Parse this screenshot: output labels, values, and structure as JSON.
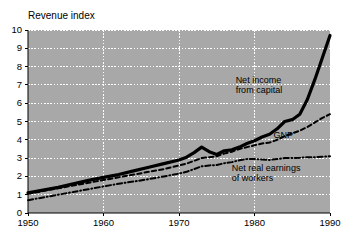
{
  "chart_data": {
    "type": "line",
    "title": "Revenue index",
    "xlabel": "",
    "ylabel": "Revenue index",
    "xlim": [
      1950,
      1990
    ],
    "ylim": [
      0,
      10
    ],
    "grid": true,
    "legend_position": "inline-annotations",
    "plot_background": "#a8a8a8",
    "grid_color": "#ffffff",
    "line_color": "#000000",
    "xticks": [
      "1950",
      "1960",
      "1970",
      "1980",
      "1990"
    ],
    "xtick_values": [
      1950,
      1960,
      1970,
      1980,
      1990
    ],
    "yticks": [
      "0",
      "1",
      "2",
      "3",
      "4",
      "5",
      "6",
      "7",
      "8",
      "9",
      "10"
    ],
    "ytick_values": [
      0,
      1,
      2,
      3,
      4,
      5,
      6,
      7,
      8,
      9,
      10
    ],
    "x": [
      1950,
      1952,
      1954,
      1956,
      1958,
      1960,
      1962,
      1964,
      1966,
      1968,
      1970,
      1971,
      1972,
      1973,
      1974,
      1975,
      1976,
      1977,
      1978,
      1979,
      1980,
      1981,
      1982,
      1983,
      1984,
      1985,
      1986,
      1987,
      1988,
      1989,
      1990
    ],
    "series": [
      {
        "name": "Net income from capital",
        "style": "solid",
        "width": 3.2,
        "annotation": "Net income\nfrom capital",
        "annotation_line1": "Net income",
        "annotation_line2": "from capital",
        "values": [
          1.1,
          1.25,
          1.4,
          1.6,
          1.78,
          1.95,
          2.1,
          2.3,
          2.5,
          2.7,
          2.9,
          3.05,
          3.3,
          3.6,
          3.35,
          3.2,
          3.4,
          3.45,
          3.6,
          3.8,
          3.95,
          4.15,
          4.3,
          4.6,
          5.0,
          5.1,
          5.4,
          6.2,
          7.3,
          8.5,
          9.7
        ]
      },
      {
        "name": "GNP",
        "style": "dashed",
        "width": 2.0,
        "annotation": "GNP",
        "values": [
          1.05,
          1.2,
          1.35,
          1.5,
          1.65,
          1.8,
          1.95,
          2.1,
          2.25,
          2.4,
          2.6,
          2.7,
          2.85,
          3.0,
          3.05,
          3.1,
          3.25,
          3.35,
          3.5,
          3.6,
          3.7,
          3.8,
          3.85,
          4.0,
          4.2,
          4.35,
          4.5,
          4.7,
          4.95,
          5.2,
          5.4
        ]
      },
      {
        "name": "Net real earnings of workers",
        "style": "dashdot",
        "width": 2.0,
        "annotation": "Net real earnings\nof workers",
        "annotation_line1": "Net real earnings",
        "annotation_line2": "of workers",
        "values": [
          0.7,
          0.85,
          1.0,
          1.15,
          1.3,
          1.45,
          1.6,
          1.72,
          1.85,
          2.0,
          2.15,
          2.25,
          2.4,
          2.55,
          2.6,
          2.62,
          2.72,
          2.78,
          2.88,
          2.95,
          2.95,
          2.92,
          2.9,
          2.95,
          3.0,
          3.0,
          3.02,
          3.05,
          3.05,
          3.08,
          3.1
        ]
      }
    ],
    "annotations": [
      {
        "text_line1": "Net income",
        "text_line2": "from capital",
        "x": 1977.5,
        "y": 7.1
      },
      {
        "text_line1": "GNP",
        "text_line2": "",
        "x": 1982.5,
        "y": 4.1
      },
      {
        "text_line1": "Net real earnings",
        "text_line2": "of workers",
        "x": 1977.0,
        "y": 2.3
      }
    ]
  }
}
